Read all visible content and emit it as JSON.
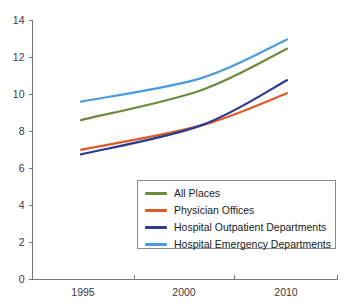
{
  "chart_data": {
    "type": "line",
    "title": "",
    "subtitle": "",
    "xlabel": "",
    "ylabel": "",
    "x": [
      1995,
      2000,
      2010
    ],
    "xtick_labels": [
      "1995",
      "2000",
      "2010"
    ],
    "ytick_labels": [
      "0",
      "2",
      "4",
      "6",
      "8",
      "10",
      "12",
      "14"
    ],
    "yticks": [
      0,
      2,
      4,
      6,
      8,
      10,
      12,
      14
    ],
    "ylim": [
      0,
      14
    ],
    "grid": false,
    "legend_position": "bottom-right",
    "series": [
      {
        "name": "All Places",
        "color": "#6E8B3D",
        "values": [
          8.6,
          10.2,
          12.45
        ]
      },
      {
        "name": "Physician Offices",
        "color": "#E05A28",
        "values": [
          7.0,
          8.3,
          10.05
        ]
      },
      {
        "name": "Hospital Outpatient Departments",
        "color": "#2B3A8F",
        "values": [
          6.75,
          8.3,
          10.75
        ]
      },
      {
        "name": "Hospital Emergency Departments",
        "color": "#4A9BE0",
        "values": [
          9.6,
          10.85,
          12.95
        ]
      }
    ]
  },
  "legend": {
    "items": [
      {
        "label": "All Places",
        "color": "#6E8B3D"
      },
      {
        "label": "Physician Offices",
        "color": "#E05A28"
      },
      {
        "label": "Hospital Outpatient Departments",
        "color": "#2B3A8F"
      },
      {
        "label": "Hospital Emergency Departments",
        "color": "#4A9BE0"
      }
    ]
  },
  "axes": {
    "y_ticks": [
      "14",
      "12",
      "10",
      "8",
      "6",
      "4",
      "2",
      "0"
    ],
    "x_ticks": [
      "1995",
      "2000",
      "2010"
    ]
  }
}
